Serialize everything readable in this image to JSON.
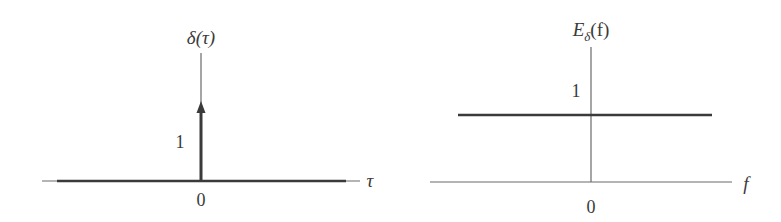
{
  "figure": {
    "left_panel": {
      "title": "δ(τ)",
      "x_axis_label": "τ",
      "origin_label": "0",
      "impulse_height_label": "1",
      "description": "Unit impulse at τ = 0 with arrow of weight 1"
    },
    "right_panel": {
      "title_main": "E",
      "title_subscript": "δ",
      "title_arg": "(f)",
      "x_axis_label": "f",
      "origin_label": "0",
      "level_label": "1",
      "description": "Flat energy spectral density of value 1 for all f"
    },
    "colors": {
      "axis": "#555555",
      "curve": "#3a3a3a",
      "background": "#ffffff"
    }
  }
}
